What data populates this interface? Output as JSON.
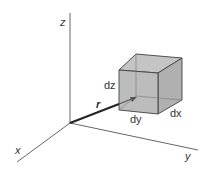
{
  "diagram": {
    "axes": {
      "x_label": "x",
      "y_label": "y",
      "z_label": "z"
    },
    "vector_label": "r",
    "cube_labels": {
      "dx": "dx",
      "dy": "dy",
      "dz": "dz"
    },
    "colors": {
      "axis": "#555555",
      "cube_fill": "#b8b8b8",
      "cube_edge": "#444444",
      "vector": "#222222"
    }
  }
}
